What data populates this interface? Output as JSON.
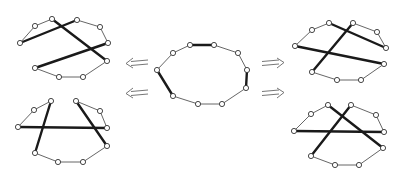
{
  "diagram": {
    "node_count": 10,
    "colors": {
      "thin_edge": "#555555",
      "bold_edge": "#1a1a1a",
      "node_fill": "#ffffff",
      "node_stroke": "#333333",
      "arrow": "#666666"
    },
    "graphs": [
      {
        "id": "center",
        "role": "source",
        "thin_edges": [
          [
            1,
            2
          ],
          [
            2,
            3
          ],
          [
            4,
            5
          ],
          [
            5,
            6
          ],
          [
            6,
            7
          ],
          [
            8,
            9
          ],
          [
            9,
            0
          ]
        ],
        "bold_edges": [
          [
            0,
            1
          ],
          [
            3,
            4
          ],
          [
            7,
            8
          ]
        ]
      },
      {
        "id": "top-left",
        "role": "result",
        "thin_edges": [
          [
            1,
            2
          ],
          [
            2,
            3
          ],
          [
            4,
            5
          ],
          [
            5,
            6
          ],
          [
            6,
            7
          ],
          [
            8,
            9
          ],
          [
            9,
            0
          ]
        ],
        "bold_edges": [
          [
            8,
            1
          ],
          [
            0,
            4
          ],
          [
            7,
            3
          ]
        ]
      },
      {
        "id": "top-right",
        "role": "result",
        "thin_edges": [
          [
            1,
            2
          ],
          [
            2,
            3
          ],
          [
            4,
            5
          ],
          [
            5,
            6
          ],
          [
            6,
            7
          ],
          [
            8,
            9
          ],
          [
            9,
            0
          ]
        ],
        "bold_edges": [
          [
            0,
            3
          ],
          [
            8,
            4
          ],
          [
            7,
            1
          ]
        ]
      },
      {
        "id": "bottom-left",
        "role": "result",
        "thin_edges": [
          [
            1,
            2
          ],
          [
            2,
            3
          ],
          [
            4,
            5
          ],
          [
            5,
            6
          ],
          [
            6,
            7
          ],
          [
            8,
            9
          ],
          [
            9,
            0
          ]
        ],
        "bold_edges": [
          [
            0,
            7
          ],
          [
            1,
            4
          ],
          [
            8,
            3
          ]
        ]
      },
      {
        "id": "bottom-right",
        "role": "result",
        "thin_edges": [
          [
            1,
            2
          ],
          [
            2,
            3
          ],
          [
            4,
            5
          ],
          [
            5,
            6
          ],
          [
            6,
            7
          ],
          [
            8,
            9
          ],
          [
            9,
            0
          ]
        ],
        "bold_edges": [
          [
            0,
            4
          ],
          [
            1,
            7
          ],
          [
            8,
            3
          ]
        ]
      }
    ],
    "arrows": [
      {
        "id": "arrow-to-top-left",
        "direction": "left"
      },
      {
        "id": "arrow-to-bottom-left",
        "direction": "left"
      },
      {
        "id": "arrow-to-top-right",
        "direction": "right"
      },
      {
        "id": "arrow-to-bottom-right",
        "direction": "right"
      }
    ]
  }
}
